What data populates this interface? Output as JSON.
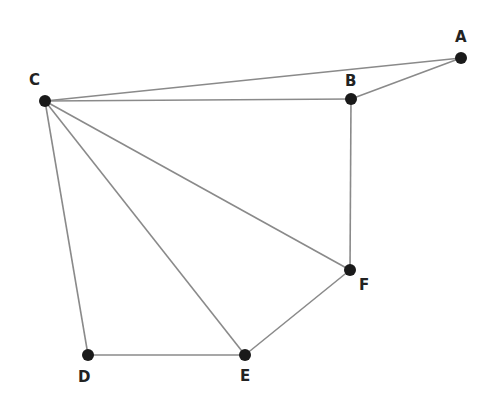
{
  "graph": {
    "nodes": [
      {
        "id": "A",
        "label": "A",
        "x": 461,
        "y": 58,
        "lx": 455,
        "ly": 42
      },
      {
        "id": "B",
        "label": "B",
        "x": 351,
        "y": 99,
        "lx": 345,
        "ly": 86
      },
      {
        "id": "C",
        "label": "C",
        "x": 45,
        "y": 101,
        "lx": 29,
        "ly": 85
      },
      {
        "id": "D",
        "label": "D",
        "x": 88,
        "y": 355,
        "lx": 78,
        "ly": 382
      },
      {
        "id": "E",
        "label": "E",
        "x": 245,
        "y": 355,
        "lx": 240,
        "ly": 381
      },
      {
        "id": "F",
        "label": "F",
        "x": 350,
        "y": 270,
        "lx": 359,
        "ly": 290
      }
    ],
    "edges": [
      [
        "C",
        "A"
      ],
      [
        "A",
        "B"
      ],
      [
        "C",
        "B"
      ],
      [
        "B",
        "F"
      ],
      [
        "C",
        "F"
      ],
      [
        "C",
        "E"
      ],
      [
        "C",
        "D"
      ],
      [
        "D",
        "E"
      ],
      [
        "E",
        "F"
      ]
    ]
  }
}
